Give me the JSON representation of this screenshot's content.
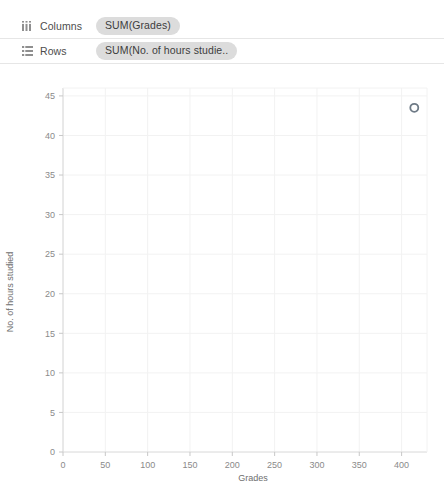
{
  "shelves": [
    {
      "icon": "columns-icon",
      "label": "Columns",
      "pill": "SUM(Grades)"
    },
    {
      "icon": "rows-icon",
      "label": "Rows",
      "pill": "SUM(No. of hours studie.."
    }
  ],
  "chart_data": {
    "type": "scatter",
    "title": "",
    "xlabel": "Grades",
    "ylabel": "No. of hours studied",
    "xlim": [
      0,
      430
    ],
    "ylim": [
      0,
      46
    ],
    "xticks": [
      0,
      50,
      100,
      150,
      200,
      250,
      300,
      350,
      400
    ],
    "yticks": [
      0,
      5,
      10,
      15,
      20,
      25,
      30,
      35,
      40,
      45
    ],
    "grid": true,
    "legend": "none",
    "marker": {
      "shape": "circle-open",
      "color": "#6e7a86",
      "size": 8
    },
    "points": [
      {
        "x": 415,
        "y": 43.5
      }
    ]
  },
  "colors": {
    "pill_bg": "#dcdcdc",
    "grid": "#f2f2f2",
    "axis": "#d8d8d8",
    "tick_text": "#8a8a8a",
    "mark": "#6e7a86"
  }
}
